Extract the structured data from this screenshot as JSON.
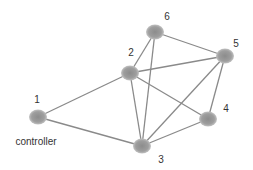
{
  "diagram": {
    "type": "network-graph",
    "colors": {
      "edge": "#8a8a8a",
      "node_center": "#8c8c8c",
      "node_edge": "#b5b5b5",
      "label": "#333333"
    },
    "nodes": [
      {
        "id": "1",
        "label": "1",
        "caption": "controller",
        "x": 38,
        "y": 117,
        "lx": 37,
        "ly": 103
      },
      {
        "id": "2",
        "label": "2",
        "x": 130,
        "y": 73,
        "lx": 131,
        "ly": 56
      },
      {
        "id": "3",
        "label": "3",
        "x": 142,
        "y": 146,
        "lx": 161,
        "ly": 163
      },
      {
        "id": "4",
        "label": "4",
        "x": 208,
        "y": 119,
        "lx": 226,
        "ly": 112
      },
      {
        "id": "5",
        "label": "5",
        "x": 225,
        "y": 56,
        "lx": 236,
        "ly": 47
      },
      {
        "id": "6",
        "label": "6",
        "x": 155,
        "y": 32,
        "lx": 167,
        "ly": 20
      }
    ],
    "edges": [
      [
        "1",
        "2"
      ],
      [
        "1",
        "3"
      ],
      [
        "2",
        "6"
      ],
      [
        "2",
        "5"
      ],
      [
        "2",
        "4"
      ],
      [
        "2",
        "3"
      ],
      [
        "6",
        "3"
      ],
      [
        "6",
        "5"
      ],
      [
        "5",
        "3"
      ],
      [
        "5",
        "4"
      ],
      [
        "4",
        "3"
      ]
    ]
  }
}
